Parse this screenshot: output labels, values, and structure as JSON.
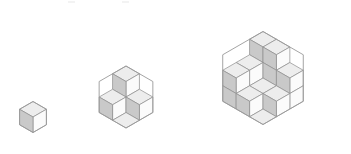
{
  "figure": {
    "background_color": "#ffffff",
    "stroke_color": "#8d8d8d",
    "stroke_width": 0.7,
    "face_colors": {
      "top": "#ededed",
      "left": "#c9c9c9",
      "right": "#fbfbfb"
    },
    "rhombus_counts": [
      3,
      12,
      27
    ],
    "hexagons": [
      {
        "name": "hexagon-side-1",
        "side": 1,
        "center_x": 33,
        "center_y": 117,
        "scale": 15.5,
        "heights": [
          [
            1
          ]
        ],
        "rhombus_count": 3
      },
      {
        "name": "hexagon-side-2",
        "side": 2,
        "center_x": 126,
        "center_y": 97,
        "scale": 15.5,
        "heights": [
          [
            2,
            1
          ],
          [
            1,
            0
          ]
        ],
        "rhombus_count": 12
      },
      {
        "name": "hexagon-side-3",
        "side": 3,
        "center_x": 263,
        "center_y": 78,
        "scale": 15.5,
        "heights": [
          [
            3,
            2,
            2
          ],
          [
            3,
            1,
            1
          ],
          [
            2,
            1,
            0
          ]
        ],
        "rhombus_count": 27
      }
    ]
  },
  "artifacts": [
    {
      "name": "top-speck-left",
      "x": 68,
      "y": 1,
      "w": 7,
      "h": 2
    },
    {
      "name": "top-speck-right",
      "x": 122,
      "y": 1,
      "w": 7,
      "h": 2
    }
  ]
}
